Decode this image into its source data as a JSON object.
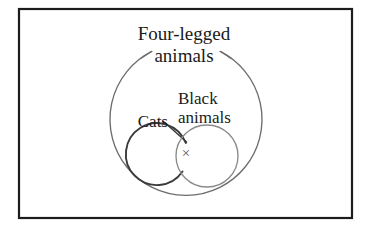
{
  "figure": {
    "kind": "euler-venn-diagram",
    "frame": {
      "border_color": "#1c1c1c",
      "background_color": "#ffffff"
    },
    "universe": {
      "name": "four-legged-animals",
      "label_line1": "Four-legged",
      "label_line2": "animals",
      "stroke_color": "#6d6d6d",
      "center_x": 186,
      "center_y": 124,
      "radius": 76
    },
    "sets": [
      {
        "name": "cats",
        "label": "Cats",
        "stroke_color": "#3a3a3a",
        "center_x": 165,
        "center_y": 156,
        "radius": 31
      },
      {
        "name": "black-animals",
        "label_line1": "Black",
        "label_line2": "animals",
        "stroke_color": "#8a8a8a",
        "center_x": 207,
        "center_y": 156,
        "radius": 31
      }
    ],
    "marks": [
      {
        "name": "intersection-x-mark",
        "glyph": "×",
        "color": "#555555",
        "x": 186,
        "y": 155,
        "meaning": "intersection is empty"
      }
    ]
  }
}
